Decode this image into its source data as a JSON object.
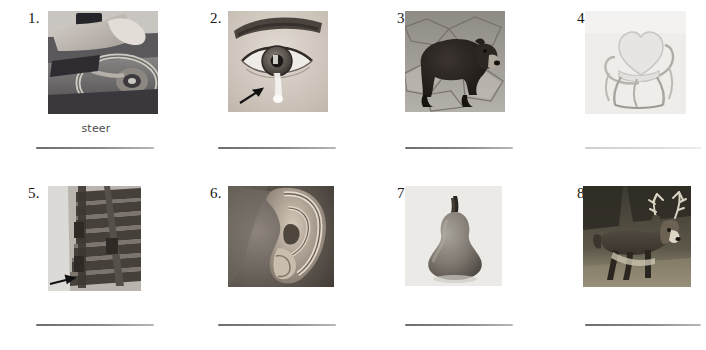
{
  "worksheet": {
    "page_background": "#ffffff",
    "ink_color": "#141414",
    "handwriting_color": "#4b4b4b",
    "rows": 2,
    "columns": 4
  },
  "items": [
    {
      "number": "1.",
      "picture_name": "steering-wheel-photo",
      "picture_caption": "hands on a car steering wheel",
      "answer": "steer",
      "has_answer": true,
      "has_arrow": false,
      "line_style": "solid"
    },
    {
      "number": "2.",
      "picture_name": "eye-with-tear-photo",
      "picture_caption": "close-up of an eye with a tear, arrow pointing to the tear",
      "answer": "",
      "has_answer": false,
      "has_arrow": true,
      "line_style": "solid"
    },
    {
      "number": "3.",
      "picture_name": "bear-photo",
      "picture_caption": "brown bear standing on rocks",
      "answer": "",
      "has_answer": false,
      "has_arrow": false,
      "line_style": "solid"
    },
    {
      "number": "4.",
      "picture_name": "chair-photo",
      "picture_caption": "metal chair with heart-shaped back",
      "answer": "",
      "has_answer": false,
      "has_arrow": false,
      "line_style": "faint"
    },
    {
      "number": "5.",
      "picture_name": "stairs-photo",
      "picture_caption": "wooden staircase, arrow pointing to a stair",
      "answer": "",
      "has_answer": false,
      "has_arrow": true,
      "line_style": "solid"
    },
    {
      "number": "6.",
      "picture_name": "ear-photo",
      "picture_caption": "close-up of a human ear",
      "answer": "",
      "has_answer": false,
      "has_arrow": false,
      "line_style": "solid"
    },
    {
      "number": "7.",
      "picture_name": "pear-photo",
      "picture_caption": "a single pear with stem",
      "answer": "",
      "has_answer": false,
      "has_arrow": false,
      "line_style": "solid"
    },
    {
      "number": "8.",
      "picture_name": "deer-photo",
      "picture_caption": "buck deer with antlers in a field",
      "answer": "",
      "has_answer": false,
      "has_arrow": false,
      "line_style": "solid"
    }
  ]
}
